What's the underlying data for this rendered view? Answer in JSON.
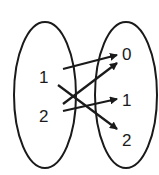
{
  "diagram": {
    "type": "mapping-diagram",
    "domain_set": {
      "elements": [
        "1",
        "2"
      ]
    },
    "codomain_set": {
      "elements": [
        "0",
        "1",
        "2"
      ]
    },
    "mappings": [
      {
        "from": "1",
        "to": "0"
      },
      {
        "from": "1",
        "to": "2"
      },
      {
        "from": "2",
        "to": "0"
      },
      {
        "from": "2",
        "to": "1"
      }
    ],
    "colors": {
      "stroke": "#1a1a1a",
      "background": "#ffffff"
    }
  }
}
